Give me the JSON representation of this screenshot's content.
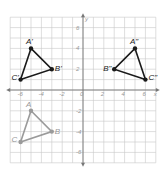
{
  "diagram": {
    "type": "coordinate-plane-transformation",
    "axes": {
      "x_label": "x",
      "y_label": "y",
      "x_ticks": [
        "-6",
        "-4",
        "-2",
        "0",
        "2",
        "4",
        "6"
      ],
      "y_ticks": [
        "6",
        "4",
        "2",
        "-2",
        "-4",
        "-6"
      ],
      "range": [
        -7,
        7
      ]
    },
    "triangles": [
      {
        "name": "ABC",
        "color": "#9a9a9a",
        "vertices": [
          {
            "label": "A",
            "x": -5,
            "y": -2
          },
          {
            "label": "B",
            "x": -3,
            "y": -4
          },
          {
            "label": "C",
            "x": -6,
            "y": -5
          }
        ]
      },
      {
        "name": "A'B'C'",
        "color": "#1a1a1a",
        "vertices": [
          {
            "label": "A'",
            "x": -5,
            "y": 4
          },
          {
            "label": "B'",
            "x": -3,
            "y": 2
          },
          {
            "label": "C'",
            "x": -6,
            "y": 1
          }
        ]
      },
      {
        "name": "A''B''C''",
        "color": "#1a1a1a",
        "vertices": [
          {
            "label": "A\"",
            "x": 5,
            "y": 4
          },
          {
            "label": "B\"",
            "x": 3,
            "y": 2
          },
          {
            "label": "C\"",
            "x": 6,
            "y": 1
          }
        ]
      }
    ]
  }
}
